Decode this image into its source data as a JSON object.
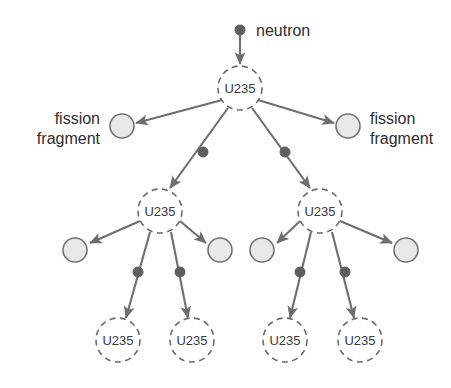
{
  "diagram": {
    "colors": {
      "line": "#6e6e6e",
      "node_stroke": "#6b6b6b",
      "node_text": "#3a3a3a",
      "fragment_fill": "#e8e8e8",
      "fragment_stroke": "#707070",
      "neutron_fill": "#5e5e5e",
      "caption_text": "#2e2e2e",
      "background": "#fefefe"
    },
    "labels": {
      "neutron": "neutron",
      "fission_fragment_line1": "fission",
      "fission_fragment_line2": "fragment",
      "nucleus": "U235"
    },
    "nuclei": [
      {
        "id": "u0",
        "label": "U235",
        "cx": 240,
        "cy": 88,
        "r": 22
      },
      {
        "id": "u1-l",
        "label": "U235",
        "cx": 160,
        "cy": 211,
        "r": 22
      },
      {
        "id": "u1-r",
        "label": "U235",
        "cx": 320,
        "cy": 211,
        "r": 22
      },
      {
        "id": "u2-a",
        "label": "U235",
        "cx": 118,
        "cy": 340,
        "r": 22
      },
      {
        "id": "u2-b",
        "label": "U235",
        "cx": 192,
        "cy": 340,
        "r": 22
      },
      {
        "id": "u2-c",
        "label": "U235",
        "cx": 285,
        "cy": 340,
        "r": 22
      },
      {
        "id": "u2-d",
        "label": "U235",
        "cx": 360,
        "cy": 340,
        "r": 22
      }
    ],
    "fragments": [
      {
        "id": "f0-l",
        "cx": 122,
        "cy": 126,
        "r": 12
      },
      {
        "id": "f0-r",
        "cx": 348,
        "cy": 126,
        "r": 12
      },
      {
        "id": "f1-a",
        "cx": 75,
        "cy": 250,
        "r": 12
      },
      {
        "id": "f1-b",
        "cx": 220,
        "cy": 250,
        "r": 12
      },
      {
        "id": "f1-c",
        "cx": 262,
        "cy": 250,
        "r": 12
      },
      {
        "id": "f1-d",
        "cx": 406,
        "cy": 250,
        "r": 12
      }
    ],
    "neutrons": [
      {
        "id": "n-src",
        "cx": 240,
        "cy": 30,
        "r": 5
      },
      {
        "id": "n-1l",
        "cx": 203,
        "cy": 152,
        "r": 5
      },
      {
        "id": "n-1r",
        "cx": 285,
        "cy": 152,
        "r": 5
      },
      {
        "id": "n-2a",
        "cx": 138,
        "cy": 272,
        "r": 5
      },
      {
        "id": "n-2b",
        "cx": 180,
        "cy": 272,
        "r": 5
      },
      {
        "id": "n-2c",
        "cx": 300,
        "cy": 272,
        "r": 5
      },
      {
        "id": "n-2d",
        "cx": 345,
        "cy": 272,
        "r": 5
      }
    ],
    "captions": [
      {
        "id": "cap-neutron",
        "text": "neutron",
        "x": 256,
        "y": 30,
        "align": "start"
      },
      {
        "id": "cap-ff-left-1",
        "text": "fission",
        "x": 100,
        "y": 118,
        "align": "end"
      },
      {
        "id": "cap-ff-left-2",
        "text": "fragment",
        "x": 100,
        "y": 138,
        "align": "end"
      },
      {
        "id": "cap-ff-right-1",
        "text": "fission",
        "x": 370,
        "y": 118,
        "align": "start"
      },
      {
        "id": "cap-ff-right-2",
        "text": "fragment",
        "x": 370,
        "y": 138,
        "align": "start"
      }
    ],
    "arrows": [
      {
        "id": "a-src",
        "x1": 240,
        "y1": 34,
        "x2": 240,
        "y2": 64
      },
      {
        "id": "a-0-ffl",
        "x1": 222,
        "y1": 100,
        "x2": 136,
        "y2": 123
      },
      {
        "id": "a-0-ffr",
        "x1": 258,
        "y1": 100,
        "x2": 334,
        "y2": 123
      },
      {
        "id": "a-0-nl",
        "x1": 228,
        "y1": 108,
        "x2": 170,
        "y2": 188
      },
      {
        "id": "a-0-nr",
        "x1": 252,
        "y1": 108,
        "x2": 310,
        "y2": 188
      },
      {
        "id": "a-1l-ffl",
        "x1": 140,
        "y1": 221,
        "x2": 90,
        "y2": 243
      },
      {
        "id": "a-1l-ffr",
        "x1": 180,
        "y1": 221,
        "x2": 206,
        "y2": 243
      },
      {
        "id": "a-1l-na",
        "x1": 150,
        "y1": 232,
        "x2": 126,
        "y2": 318
      },
      {
        "id": "a-1l-nb",
        "x1": 171,
        "y1": 232,
        "x2": 188,
        "y2": 318
      },
      {
        "id": "a-1r-ffl",
        "x1": 300,
        "y1": 221,
        "x2": 277,
        "y2": 243
      },
      {
        "id": "a-1r-ffr",
        "x1": 340,
        "y1": 221,
        "x2": 392,
        "y2": 243
      },
      {
        "id": "a-1r-nc",
        "x1": 311,
        "y1": 232,
        "x2": 290,
        "y2": 318
      },
      {
        "id": "a-1r-nd",
        "x1": 332,
        "y1": 232,
        "x2": 354,
        "y2": 318
      }
    ]
  }
}
